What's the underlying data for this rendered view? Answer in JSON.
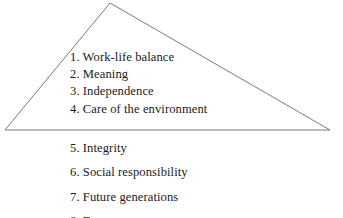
{
  "figure": {
    "background_color": "#ffffff",
    "stroke_color": "#7a7a7a",
    "text_color": "#1a1a1a",
    "shape_name": "triangle",
    "apex": {
      "x": 110,
      "y": 3
    },
    "base_left": {
      "x": 5,
      "y": 130
    },
    "base_right": {
      "x": 330,
      "y": 130
    }
  },
  "upper_list": {
    "items": [
      {
        "number": "1.",
        "label": "Work-life balance",
        "full": "1. Work-life balance"
      },
      {
        "number": "2.",
        "label": "Meaning",
        "full": "2. Meaning"
      },
      {
        "number": "3.",
        "label": "Independence",
        "full": "3. Independence"
      },
      {
        "number": "4.",
        "label": "Care of the environment",
        "full": "4. Care of the environment"
      }
    ]
  },
  "lower_list": {
    "items": [
      {
        "number": "5.",
        "label": "Integrity",
        "full": "5. Integrity"
      },
      {
        "number": "6.",
        "label": "Social responsibility",
        "full": "6. Social responsibility"
      },
      {
        "number": "7.",
        "label": "Future generations",
        "full": "7. Future generations"
      },
      {
        "number": "8.",
        "label": "D",
        "full": "8. D",
        "clipped": true
      }
    ]
  }
}
